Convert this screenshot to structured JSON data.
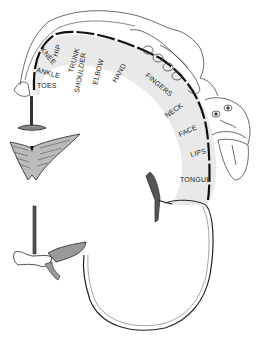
{
  "diagram": {
    "type": "motor-homunculus",
    "labels": [
      {
        "id": "toes",
        "text": "TOES",
        "x": 36,
        "y": 58,
        "rot": 0
      },
      {
        "id": "ankle",
        "text": "ANKLE",
        "x": 34,
        "y": 44,
        "rot": 15
      },
      {
        "id": "knee",
        "text": "KNEE",
        "x": 40,
        "y": 45,
        "rot": 55
      },
      {
        "id": "hip",
        "text": "HIP",
        "x": 56,
        "y": 40,
        "rot": -70
      },
      {
        "id": "trunk",
        "text": "TRUNK",
        "x": 73,
        "y": 60,
        "rot": -75
      },
      {
        "id": "shoulder",
        "text": "SHOULDER",
        "x": 80,
        "y": 80,
        "rot": -80
      },
      {
        "id": "elbow",
        "text": "ELBOW",
        "x": 97,
        "y": 73,
        "rot": -75
      },
      {
        "id": "hand",
        "text": "HAND",
        "x": 118,
        "y": 74,
        "rot": -60
      },
      {
        "id": "fingers",
        "text": "FINGERS",
        "x": 145,
        "y": 77,
        "rot": 38
      },
      {
        "id": "neck",
        "text": "NECK",
        "x": 166,
        "y": 117,
        "rot": -35
      },
      {
        "id": "face",
        "text": "FACE",
        "x": 180,
        "y": 140,
        "rot": -25
      },
      {
        "id": "lips",
        "text": "LIPS",
        "x": 191,
        "y": 157,
        "rot": -15
      },
      {
        "id": "tongue",
        "text": "TONGUE",
        "x": 180,
        "y": 181,
        "rot": 0
      }
    ],
    "colors": {
      "line": "#1a1a1a",
      "cortex_shade": "#e6e6e6",
      "background": "#ffffff"
    }
  }
}
